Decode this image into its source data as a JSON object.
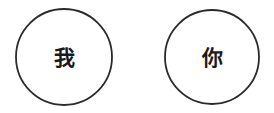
{
  "canvas": {
    "width": 274,
    "height": 113,
    "background_color": "#ffffff"
  },
  "style": {
    "stroke_color": "#2b2b2b",
    "stroke_width": 1.8,
    "fill_color": "#ffffff",
    "text_color": "#1a1a1a",
    "font_size": 21
  },
  "diagram": {
    "type": "two-circle-nodes",
    "nodes": [
      {
        "id": "node-wo",
        "label": "我",
        "romanization": "wo",
        "cx": 64,
        "cy": 57,
        "r": 48,
        "label_x": 64,
        "label_y": 58
      },
      {
        "id": "node-ni",
        "label": "你",
        "romanization": "ni",
        "cx": 212,
        "cy": 57,
        "r": 47,
        "label_x": 212,
        "label_y": 58
      }
    ]
  }
}
